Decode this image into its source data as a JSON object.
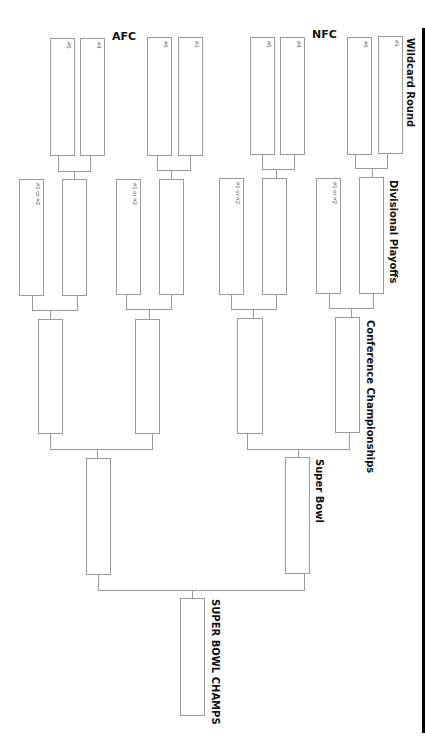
{
  "conferences": {
    "afc": "AFC",
    "nfc": "NFC"
  },
  "rounds": {
    "wildcard": "Wildcard Round",
    "divisional": "Divisional Playoffs",
    "conference": "Conference Championships",
    "superbowl": "Super Bowl",
    "champs": "SUPER BOWL CHAMPS"
  },
  "wildcard_seeds": {
    "afc": [
      "#5",
      "#4",
      "#6",
      "#3"
    ],
    "nfc": [
      "#5",
      "#4",
      "#6",
      "#3"
    ]
  },
  "divisional_seed": "#1 or #2",
  "colors": {
    "line": "#9a9a9a",
    "border": "#000000",
    "text": "#111111"
  }
}
